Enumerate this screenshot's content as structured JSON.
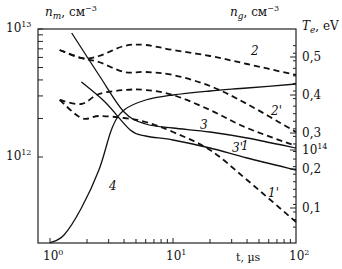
{
  "chart_data": {
    "type": "line",
    "title": "",
    "xlabel": "t, µs",
    "xscale": "log",
    "xlim": [
      1,
      100
    ],
    "x_ticks": [
      "10^0",
      "10^1",
      "10^2"
    ],
    "ylabel_left": "n_m, см^-3",
    "yscale_left": "log",
    "ylim_left": [
      200000000000.0,
      10000000000000.0
    ],
    "y_ticks_left": [
      "10^13",
      "10^12"
    ],
    "ylabel_right_top": "n_g, см^-3",
    "ylabel_right": "T_e, eV",
    "ylim_right": [
      0.0,
      0.55
    ],
    "y_ticks_right": [
      "0,5",
      "0,4",
      "0,3",
      "0,2",
      "0,1"
    ],
    "y_tick_right_extra": "10^14",
    "grid": false,
    "legend": "inline curve labels",
    "series": [
      {
        "name": "1",
        "style": "dashed",
        "axis": "n_g",
        "x": [
          1.2,
          1.8,
          2.5,
          4,
          6,
          10,
          20,
          40,
          100
        ],
        "y_px": [
          100,
          104,
          94,
          90,
          90,
          95,
          110,
          128,
          146
        ]
      },
      {
        "name": "1'",
        "style": "dashed",
        "axis": "n_g",
        "x": [
          1.2,
          1.8,
          2.5,
          4,
          6,
          10,
          20,
          40,
          100
        ],
        "y_px": [
          100,
          118,
          116,
          118,
          122,
          132,
          150,
          180,
          222
        ]
      },
      {
        "name": "2",
        "style": "dashed",
        "axis": "n_g",
        "x": [
          1.2,
          1.8,
          2.5,
          4,
          6,
          10,
          20,
          40,
          100
        ],
        "y_px": [
          50,
          58,
          56,
          46,
          45,
          50,
          56,
          64,
          75
        ]
      },
      {
        "name": "2'",
        "style": "dashed",
        "axis": "n_g",
        "x": [
          1.2,
          1.8,
          2.5,
          4,
          6,
          10,
          20,
          40,
          100
        ],
        "y_px": [
          50,
          58,
          62,
          72,
          72,
          75,
          86,
          104,
          132
        ]
      },
      {
        "name": "3",
        "style": "solid",
        "axis": "n_m",
        "x": [
          1.5,
          2.5,
          4,
          6,
          10,
          20,
          40,
          100
        ],
        "y_px": [
          33,
          75,
          112,
          124,
          128,
          132,
          138,
          148
        ]
      },
      {
        "name": "3'",
        "style": "solid",
        "axis": "n_m",
        "x": [
          1.8,
          2.8,
          4.5,
          6,
          10,
          20,
          40,
          100
        ],
        "y_px": [
          82,
          102,
          130,
          136,
          140,
          148,
          158,
          170
        ]
      },
      {
        "name": "4",
        "style": "solid",
        "axis": "T_e",
        "x": [
          1.0,
          1.3,
          1.8,
          2.5,
          3.2,
          4,
          6,
          10,
          20,
          40,
          100
        ],
        "y_px": [
          243,
          235,
          208,
          170,
          128,
          110,
          100,
          95,
          91,
          88,
          84
        ]
      }
    ],
    "curve_labels": [
      {
        "text": "1",
        "x": 241,
        "y": 150
      },
      {
        "text": "1'",
        "x": 268,
        "y": 197
      },
      {
        "text": "2",
        "x": 251,
        "y": 55
      },
      {
        "text": "2'",
        "x": 271,
        "y": 115
      },
      {
        "text": "3",
        "x": 200,
        "y": 129
      },
      {
        "text": "3'",
        "x": 232,
        "y": 152
      },
      {
        "text": "4",
        "x": 109,
        "y": 190
      }
    ]
  },
  "labels": {
    "y_left_title": "n",
    "y_left_sub": "m",
    "y_left_units": ", см",
    "y_left_exp": "−3",
    "y_right_top_title": "n",
    "y_right_top_sub": "g",
    "y_right_top_units": ", см",
    "y_right_top_exp": "−3",
    "y_right_title": "T",
    "y_right_sub": "e",
    "y_right_units": ", eV",
    "x_title": "t, µs",
    "tick_1e13_base": "10",
    "tick_1e13_exp": "13",
    "tick_1e12_base": "10",
    "tick_1e12_exp": "12",
    "tick_x0_base": "10",
    "tick_x0_exp": "0",
    "tick_x1_base": "10",
    "tick_x1_exp": "1",
    "tick_x2_base": "10",
    "tick_x2_exp": "2",
    "tick_r05": "0,5",
    "tick_r04": "0,4",
    "tick_r03": "0,3",
    "tick_r02": "0,2",
    "tick_r01": "0,1",
    "tick_r1e14_base": "10",
    "tick_r1e14_exp": "14"
  }
}
